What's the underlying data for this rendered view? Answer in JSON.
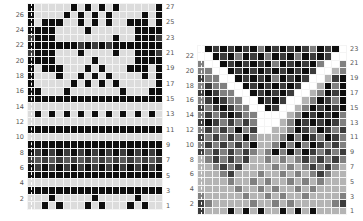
{
  "charts": [
    {
      "id": "left",
      "cols": 19,
      "rows": 27,
      "left_labels": [
        "26",
        "24",
        "22",
        "20",
        "18",
        "16",
        "14",
        "12",
        "10",
        "8",
        "6",
        "4",
        "2"
      ],
      "right_labels": [
        "27",
        "25",
        "23",
        "21",
        "19",
        "17",
        "15",
        "13",
        "11",
        "9",
        "7",
        "5",
        "3",
        "1"
      ],
      "grid_top_to_bottom": [
        "1000001010101000001",
        "1000010101010000101",
        "1011100101010011101",
        "1111000010000001111",
        "2111000000001001112",
        "1111111212121111111",
        "2111000100001001112",
        "1111000001000001111",
        "1011100010100011101",
        "1000100101010000101",
        "1000001010101000001",
        "1100010000000100011",
        "1111111111111111111",
        "0000000000000000000",
        "0101010101010101010",
        "0000000000000000000",
        "1111111111111111111",
        "0000000000000000000",
        "1111111111111111111",
        "1212121212121212121",
        "2626262626262626262",
        "1212121212121212121",
        "1111111111111111111",
        "0000000000000000000",
        "1111111111111111111",
        "0001000001000001000",
        "0010100010100010100"
      ]
    },
    {
      "id": "right",
      "cols": 20,
      "rows": 23,
      "left_labels": [
        "22",
        "20",
        "18",
        "16",
        "14",
        "12",
        "10",
        "8",
        "6",
        "4",
        "2"
      ],
      "right_labels": [
        "23",
        "21",
        "19",
        "17",
        "15",
        "13",
        "11",
        "9",
        "7",
        "5",
        "3",
        "1"
      ],
      "grid_top_to_bottom": [
        "41212121312121231214",
        "44121312131213121244",
        "34412121213121213443",
        "33441212121212124453",
        "23344121213121244521",
        "32334412121212445131",
        "21233441212124453121",
        "32123344121244531231",
        "23212334412445312121",
        "32321233444453121213",
        "21232323444531212123",
        "32323132445531231232",
        "23232313555313123123",
        "32323231553131312323",
        "23232323531313123232",
        "53232325535353232323",
        "55323255553535323235",
        "55532555355353532355",
        "55553553535535353555",
        "55555355353553535555",
        "35555535535355355553",
        "23555553553535555532",
        "25551515155151515555"
      ]
    }
  ],
  "palette": {
    "0": "#dcdcdc",
    "1": "#0e0e0e",
    "2": "#3c3c3c",
    "3": "#808080",
    "4": "#ffffff",
    "5": "#b4b4b4",
    "6": "#5a5a5a"
  }
}
